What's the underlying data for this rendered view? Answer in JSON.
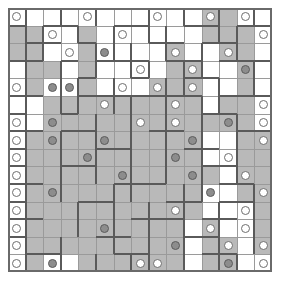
{
  "puzzle": {
    "title": "",
    "type": "grid-logic-puzzle",
    "grid": {
      "rows": 15,
      "cols": 15,
      "cell_px": 17.6
    },
    "colors": {
      "background": "#ffffff",
      "shaded_cell": "#b9b9b9",
      "unshaded_cell": "#ffffff",
      "thin_line": "#9a9a9a",
      "region_border": "#5a5a5a",
      "frame": "#6a6a6a",
      "white_pearl_fill": "#ffffff",
      "white_pearl_stroke": "#6e6e6e",
      "gray_pearl_fill": "#8d8d8d",
      "gray_pearl_stroke": "#5c5c5c"
    },
    "shading": [
      "000000000001100",
      "110010000001110",
      "110010000100110",
      "011010000110010",
      "010010001110010",
      "001111111110110",
      "001111111111110",
      "011111111110011",
      "011111111110011",
      "011111111111011",
      "011111111110011",
      "011111111110001",
      "011111111101001",
      "011111111101101",
      "010011111101100"
    ],
    "pearls": [
      {
        "r": 0,
        "c": 0,
        "kind": "white"
      },
      {
        "r": 0,
        "c": 4,
        "kind": "white"
      },
      {
        "r": 0,
        "c": 8,
        "kind": "white"
      },
      {
        "r": 0,
        "c": 11,
        "kind": "white"
      },
      {
        "r": 0,
        "c": 13,
        "kind": "white"
      },
      {
        "r": 1,
        "c": 2,
        "kind": "white"
      },
      {
        "r": 1,
        "c": 6,
        "kind": "white"
      },
      {
        "r": 1,
        "c": 14,
        "kind": "white"
      },
      {
        "r": 2,
        "c": 3,
        "kind": "white"
      },
      {
        "r": 2,
        "c": 5,
        "kind": "gray"
      },
      {
        "r": 2,
        "c": 9,
        "kind": "white"
      },
      {
        "r": 2,
        "c": 12,
        "kind": "white"
      },
      {
        "r": 3,
        "c": 7,
        "kind": "white"
      },
      {
        "r": 3,
        "c": 10,
        "kind": "white"
      },
      {
        "r": 3,
        "c": 13,
        "kind": "gray"
      },
      {
        "r": 4,
        "c": 0,
        "kind": "white"
      },
      {
        "r": 4,
        "c": 2,
        "kind": "gray"
      },
      {
        "r": 4,
        "c": 3,
        "kind": "gray"
      },
      {
        "r": 4,
        "c": 6,
        "kind": "white"
      },
      {
        "r": 4,
        "c": 8,
        "kind": "white"
      },
      {
        "r": 4,
        "c": 10,
        "kind": "white"
      },
      {
        "r": 5,
        "c": 5,
        "kind": "white"
      },
      {
        "r": 5,
        "c": 9,
        "kind": "white"
      },
      {
        "r": 5,
        "c": 14,
        "kind": "white"
      },
      {
        "r": 6,
        "c": 0,
        "kind": "white"
      },
      {
        "r": 6,
        "c": 2,
        "kind": "gray"
      },
      {
        "r": 6,
        "c": 7,
        "kind": "white"
      },
      {
        "r": 6,
        "c": 9,
        "kind": "white"
      },
      {
        "r": 6,
        "c": 12,
        "kind": "gray"
      },
      {
        "r": 6,
        "c": 14,
        "kind": "white"
      },
      {
        "r": 7,
        "c": 0,
        "kind": "white"
      },
      {
        "r": 7,
        "c": 2,
        "kind": "gray"
      },
      {
        "r": 7,
        "c": 5,
        "kind": "gray"
      },
      {
        "r": 7,
        "c": 10,
        "kind": "gray"
      },
      {
        "r": 7,
        "c": 14,
        "kind": "white"
      },
      {
        "r": 8,
        "c": 0,
        "kind": "white"
      },
      {
        "r": 8,
        "c": 4,
        "kind": "gray"
      },
      {
        "r": 8,
        "c": 9,
        "kind": "gray"
      },
      {
        "r": 8,
        "c": 12,
        "kind": "white"
      },
      {
        "r": 9,
        "c": 0,
        "kind": "white"
      },
      {
        "r": 9,
        "c": 6,
        "kind": "gray"
      },
      {
        "r": 9,
        "c": 10,
        "kind": "gray"
      },
      {
        "r": 9,
        "c": 13,
        "kind": "white"
      },
      {
        "r": 10,
        "c": 0,
        "kind": "white"
      },
      {
        "r": 10,
        "c": 2,
        "kind": "gray"
      },
      {
        "r": 10,
        "c": 11,
        "kind": "gray"
      },
      {
        "r": 10,
        "c": 14,
        "kind": "white"
      },
      {
        "r": 11,
        "c": 0,
        "kind": "white"
      },
      {
        "r": 11,
        "c": 9,
        "kind": "white"
      },
      {
        "r": 11,
        "c": 13,
        "kind": "white"
      },
      {
        "r": 12,
        "c": 0,
        "kind": "white"
      },
      {
        "r": 12,
        "c": 5,
        "kind": "gray"
      },
      {
        "r": 12,
        "c": 11,
        "kind": "white"
      },
      {
        "r": 12,
        "c": 13,
        "kind": "white"
      },
      {
        "r": 13,
        "c": 0,
        "kind": "white"
      },
      {
        "r": 13,
        "c": 9,
        "kind": "gray"
      },
      {
        "r": 13,
        "c": 12,
        "kind": "white"
      },
      {
        "r": 13,
        "c": 14,
        "kind": "white"
      },
      {
        "r": 14,
        "c": 0,
        "kind": "white"
      },
      {
        "r": 14,
        "c": 2,
        "kind": "gray"
      },
      {
        "r": 14,
        "c": 7,
        "kind": "white"
      },
      {
        "r": 14,
        "c": 8,
        "kind": "white"
      },
      {
        "r": 14,
        "c": 12,
        "kind": "gray"
      },
      {
        "r": 14,
        "c": 14,
        "kind": "white"
      }
    ],
    "region_edges_h": [
      {
        "r": 1,
        "c": 0,
        "len": 1
      },
      {
        "r": 1,
        "c": 2,
        "len": 2
      },
      {
        "r": 1,
        "c": 6,
        "len": 2
      },
      {
        "r": 1,
        "c": 10,
        "len": 2
      },
      {
        "r": 1,
        "c": 13,
        "len": 2
      },
      {
        "r": 2,
        "c": 1,
        "len": 2
      },
      {
        "r": 2,
        "c": 4,
        "len": 1
      },
      {
        "r": 2,
        "c": 8,
        "len": 2
      },
      {
        "r": 2,
        "c": 11,
        "len": 2
      },
      {
        "r": 3,
        "c": 0,
        "len": 2
      },
      {
        "r": 3,
        "c": 3,
        "len": 1
      },
      {
        "r": 3,
        "c": 5,
        "len": 1
      },
      {
        "r": 3,
        "c": 6,
        "len": 2
      },
      {
        "r": 3,
        "c": 9,
        "len": 2
      },
      {
        "r": 3,
        "c": 12,
        "len": 3
      },
      {
        "r": 4,
        "c": 4,
        "len": 1
      },
      {
        "r": 4,
        "c": 7,
        "len": 1
      },
      {
        "r": 4,
        "c": 10,
        "len": 2
      },
      {
        "r": 5,
        "c": 0,
        "len": 2
      },
      {
        "r": 5,
        "c": 4,
        "len": 2
      },
      {
        "r": 5,
        "c": 6,
        "len": 2
      },
      {
        "r": 5,
        "c": 8,
        "len": 3
      },
      {
        "r": 5,
        "c": 12,
        "len": 3
      },
      {
        "r": 6,
        "c": 0,
        "len": 1
      },
      {
        "r": 6,
        "c": 3,
        "len": 1
      },
      {
        "r": 6,
        "c": 11,
        "len": 2
      },
      {
        "r": 7,
        "c": 0,
        "len": 2
      },
      {
        "r": 7,
        "c": 3,
        "len": 2
      },
      {
        "r": 7,
        "c": 8,
        "len": 2
      },
      {
        "r": 7,
        "c": 13,
        "len": 2
      },
      {
        "r": 8,
        "c": 0,
        "len": 1
      },
      {
        "r": 8,
        "c": 5,
        "len": 2
      },
      {
        "r": 8,
        "c": 10,
        "len": 2
      },
      {
        "r": 9,
        "c": 0,
        "len": 1
      },
      {
        "r": 9,
        "c": 3,
        "len": 2
      },
      {
        "r": 9,
        "c": 11,
        "len": 2
      },
      {
        "r": 10,
        "c": 0,
        "len": 2
      },
      {
        "r": 10,
        "c": 6,
        "len": 3
      },
      {
        "r": 10,
        "c": 12,
        "len": 2
      },
      {
        "r": 11,
        "c": 0,
        "len": 1
      },
      {
        "r": 11,
        "c": 4,
        "len": 2
      },
      {
        "r": 11,
        "c": 9,
        "len": 2
      },
      {
        "r": 11,
        "c": 12,
        "len": 2
      },
      {
        "r": 12,
        "c": 0,
        "len": 2
      },
      {
        "r": 12,
        "c": 7,
        "len": 3
      },
      {
        "r": 12,
        "c": 11,
        "len": 2
      },
      {
        "r": 13,
        "c": 0,
        "len": 1
      },
      {
        "r": 13,
        "c": 5,
        "len": 2
      },
      {
        "r": 13,
        "c": 10,
        "len": 2
      },
      {
        "r": 14,
        "c": 1,
        "len": 2
      },
      {
        "r": 14,
        "c": 6,
        "len": 2
      },
      {
        "r": 14,
        "c": 11,
        "len": 2
      }
    ],
    "region_edges_v": [
      {
        "r": 0,
        "c": 1,
        "len": 2
      },
      {
        "r": 0,
        "c": 3,
        "len": 1
      },
      {
        "r": 0,
        "c": 5,
        "len": 1
      },
      {
        "r": 0,
        "c": 8,
        "len": 2
      },
      {
        "r": 0,
        "c": 10,
        "len": 1
      },
      {
        "r": 0,
        "c": 12,
        "len": 2
      },
      {
        "r": 0,
        "c": 14,
        "len": 1
      },
      {
        "r": 1,
        "c": 2,
        "len": 2
      },
      {
        "r": 1,
        "c": 4,
        "len": 1
      },
      {
        "r": 1,
        "c": 6,
        "len": 2
      },
      {
        "r": 1,
        "c": 9,
        "len": 2
      },
      {
        "r": 1,
        "c": 13,
        "len": 2
      },
      {
        "r": 2,
        "c": 1,
        "len": 2
      },
      {
        "r": 2,
        "c": 5,
        "len": 2
      },
      {
        "r": 2,
        "c": 7,
        "len": 2
      },
      {
        "r": 2,
        "c": 11,
        "len": 2
      },
      {
        "r": 3,
        "c": 3,
        "len": 2
      },
      {
        "r": 3,
        "c": 8,
        "len": 1
      },
      {
        "r": 3,
        "c": 10,
        "len": 2
      },
      {
        "r": 3,
        "c": 14,
        "len": 2
      },
      {
        "r": 4,
        "c": 1,
        "len": 2
      },
      {
        "r": 4,
        "c": 4,
        "len": 2
      },
      {
        "r": 4,
        "c": 6,
        "len": 2
      },
      {
        "r": 4,
        "c": 9,
        "len": 2
      },
      {
        "r": 4,
        "c": 12,
        "len": 2
      },
      {
        "r": 5,
        "c": 3,
        "len": 1
      },
      {
        "r": 5,
        "c": 7,
        "len": 2
      },
      {
        "r": 5,
        "c": 11,
        "len": 2
      },
      {
        "r": 6,
        "c": 1,
        "len": 2
      },
      {
        "r": 6,
        "c": 5,
        "len": 2
      },
      {
        "r": 6,
        "c": 9,
        "len": 2
      },
      {
        "r": 6,
        "c": 13,
        "len": 2
      },
      {
        "r": 7,
        "c": 3,
        "len": 2
      },
      {
        "r": 7,
        "c": 7,
        "len": 2
      },
      {
        "r": 7,
        "c": 11,
        "len": 2
      },
      {
        "r": 8,
        "c": 1,
        "len": 2
      },
      {
        "r": 8,
        "c": 5,
        "len": 2
      },
      {
        "r": 8,
        "c": 9,
        "len": 2
      },
      {
        "r": 8,
        "c": 13,
        "len": 2
      },
      {
        "r": 9,
        "c": 3,
        "len": 2
      },
      {
        "r": 9,
        "c": 7,
        "len": 2
      },
      {
        "r": 9,
        "c": 11,
        "len": 2
      },
      {
        "r": 10,
        "c": 1,
        "len": 2
      },
      {
        "r": 10,
        "c": 6,
        "len": 2
      },
      {
        "r": 10,
        "c": 10,
        "len": 2
      },
      {
        "r": 10,
        "c": 14,
        "len": 2
      },
      {
        "r": 11,
        "c": 4,
        "len": 2
      },
      {
        "r": 11,
        "c": 8,
        "len": 2
      },
      {
        "r": 11,
        "c": 12,
        "len": 2
      },
      {
        "r": 12,
        "c": 1,
        "len": 2
      },
      {
        "r": 12,
        "c": 6,
        "len": 2
      },
      {
        "r": 12,
        "c": 10,
        "len": 2
      },
      {
        "r": 12,
        "c": 14,
        "len": 2
      },
      {
        "r": 13,
        "c": 3,
        "len": 2
      },
      {
        "r": 13,
        "c": 8,
        "len": 2
      },
      {
        "r": 13,
        "c": 12,
        "len": 2
      },
      {
        "r": 14,
        "c": 1,
        "len": 1
      },
      {
        "r": 14,
        "c": 5,
        "len": 1
      },
      {
        "r": 14,
        "c": 7,
        "len": 1
      },
      {
        "r": 14,
        "c": 10,
        "len": 1
      },
      {
        "r": 14,
        "c": 13,
        "len": 1
      }
    ]
  }
}
